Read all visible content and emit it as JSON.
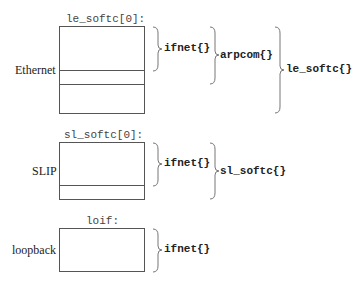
{
  "groups": [
    {
      "name": "ethernet",
      "title": "le_softc[0]:",
      "label": "Ethernet",
      "braces": [
        "ifnet{}",
        "arpcom{}",
        "le_softc{}"
      ]
    },
    {
      "name": "slip",
      "title": "sl_softc[0]:",
      "label": "SLIP",
      "braces": [
        "ifnet{}",
        "sl_softc{}"
      ]
    },
    {
      "name": "loopback",
      "title": "loif:",
      "label": "loopback",
      "braces": [
        "ifnet{}"
      ]
    }
  ]
}
